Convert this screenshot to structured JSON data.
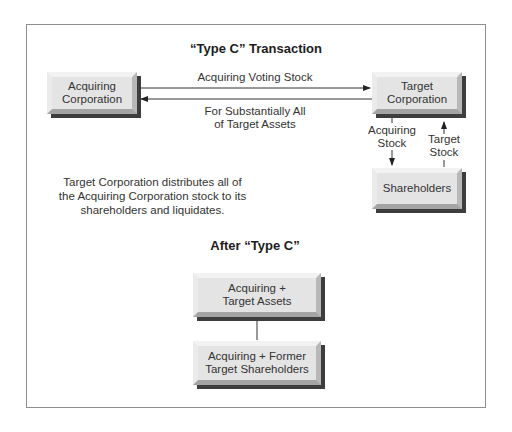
{
  "diagram": {
    "title": "“Type C” Transaction",
    "nodes": {
      "acquiring_corporation": "Acquiring\nCorporation",
      "target_corporation": "Target\nCorporation",
      "shareholders": "Shareholders",
      "combined_assets": "Acquiring +\nTarget Assets",
      "combined_shareholders": "Acquiring + Former\nTarget Shareholders"
    },
    "edges": {
      "voting_stock": "Acquiring Voting Stock",
      "target_assets": "For Substantially All\nof Target Assets",
      "acquiring_stock": "Acquiring\nStock",
      "target_stock": "Target\nStock"
    },
    "note": "Target Corporation distributes all of\nthe Acquiring Corporation stock to its\nshareholders and liquidates.",
    "after_title": "After “Type C”"
  }
}
